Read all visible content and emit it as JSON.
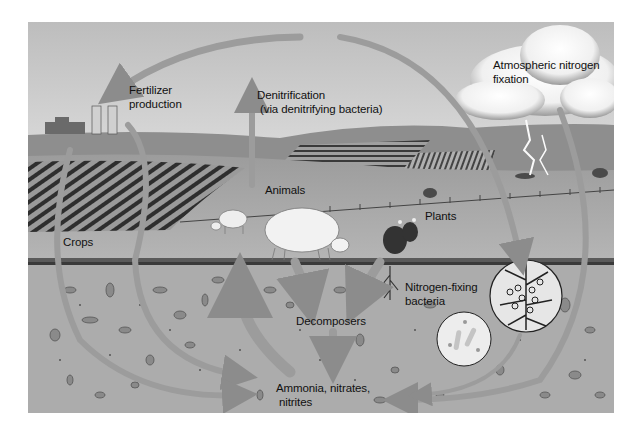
{
  "diagram": {
    "palette": {
      "sky": "#c8c8c8",
      "hills": "#8f8f8f",
      "field": "#a9a9a9",
      "soil": "#aeaeae",
      "arrow": "#9a9a9a",
      "text": "#111111"
    },
    "labels": {
      "fertilizer_line1": "Fertilizer",
      "fertilizer_line2": "production",
      "denitrification_line1": "Denitrification",
      "denitrification_line2": "(via denitrifying bacteria)",
      "atmospheric_line1": "Atmospheric nitrogen",
      "atmospheric_line2": "fixation",
      "animals": "Animals",
      "plants": "Plants",
      "crops": "Crops",
      "nitrogen_fixing_line1": "Nitrogen-fixing",
      "nitrogen_fixing_line2": "bacteria",
      "decomposers": "Decomposers",
      "ammonia_line1": "Ammonia, nitrates,",
      "ammonia_line2": "nitrites"
    },
    "nodes": [
      {
        "id": "atmosphere",
        "label": "Atmospheric nitrogen fixation"
      },
      {
        "id": "fertilizer",
        "label": "Fertilizer production"
      },
      {
        "id": "crops",
        "label": "Crops"
      },
      {
        "id": "animals",
        "label": "Animals"
      },
      {
        "id": "plants",
        "label": "Plants"
      },
      {
        "id": "decomposers",
        "label": "Decomposers"
      },
      {
        "id": "soil_compounds",
        "label": "Ammonia, nitrates, nitrites"
      },
      {
        "id": "nitrogen_fixing_bacteria",
        "label": "Nitrogen-fixing bacteria"
      },
      {
        "id": "denitrification",
        "label": "Denitrification (via denitrifying bacteria)"
      }
    ],
    "edges": [
      {
        "from": "atmosphere",
        "to": "fertilizer"
      },
      {
        "from": "atmosphere",
        "to": "nitrogen_fixing_bacteria"
      },
      {
        "from": "atmosphere",
        "to": "soil_compounds"
      },
      {
        "from": "fertilizer",
        "to": "soil_compounds"
      },
      {
        "from": "crops",
        "to": "soil_compounds"
      },
      {
        "from": "animals",
        "to": "decomposers"
      },
      {
        "from": "plants",
        "to": "decomposers"
      },
      {
        "from": "decomposers",
        "to": "soil_compounds"
      },
      {
        "from": "soil_compounds",
        "to": "plants"
      },
      {
        "from": "nitrogen_fixing_bacteria",
        "to": "soil_compounds"
      },
      {
        "from": "soil_compounds",
        "to": "denitrification"
      }
    ]
  }
}
